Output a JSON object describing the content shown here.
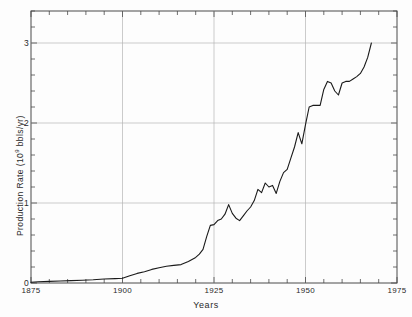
{
  "chart_data": {
    "type": "line",
    "title": "",
    "xlabel": "Years",
    "ylabel": "Production Rate (10⁹ bbls/yr)",
    "ylabel_prefix": "Production Rate (10",
    "ylabel_exponent": "9",
    "ylabel_suffix": " bbls/yr)",
    "xlim": [
      1875,
      1975
    ],
    "ylim": [
      0,
      3.4
    ],
    "xticks": [
      1875,
      1900,
      1925,
      1950,
      1975
    ],
    "xtick_labels": [
      "1875",
      "1900",
      "1925",
      "1950",
      "1975"
    ],
    "xminor_step": 5,
    "yticks": [
      0,
      1,
      2,
      3
    ],
    "ytick_labels": [
      "0",
      "1",
      "2",
      "3"
    ],
    "yminor_step": 0.2,
    "grid": "major-y-and-x",
    "line_color": "#1a1a1a",
    "axis_color": "#4a4a4a",
    "grid_color": "#b4b4b4",
    "background_color": "#fdfdfd",
    "legend": null,
    "series": [
      {
        "name": "World crude oil production rate",
        "x": [
          1875,
          1877,
          1880,
          1883,
          1886,
          1889,
          1892,
          1895,
          1898,
          1900,
          1902,
          1904,
          1906,
          1908,
          1910,
          1912,
          1914,
          1916,
          1918,
          1920,
          1921,
          1922,
          1923,
          1924,
          1925,
          1926,
          1927,
          1928,
          1929,
          1930,
          1931,
          1932,
          1933,
          1934,
          1935,
          1936,
          1937,
          1938,
          1939,
          1940,
          1941,
          1942,
          1943,
          1944,
          1945,
          1946,
          1947,
          1948,
          1949,
          1950,
          1951,
          1952,
          1953,
          1954,
          1955,
          1956,
          1957,
          1958,
          1959,
          1960,
          1961,
          1962,
          1963,
          1964,
          1965,
          1966,
          1967,
          1968
        ],
        "values": [
          0.01,
          0.015,
          0.02,
          0.025,
          0.03,
          0.035,
          0.04,
          0.05,
          0.055,
          0.06,
          0.09,
          0.12,
          0.14,
          0.17,
          0.19,
          0.21,
          0.22,
          0.23,
          0.27,
          0.32,
          0.36,
          0.42,
          0.58,
          0.72,
          0.73,
          0.78,
          0.8,
          0.86,
          0.98,
          0.87,
          0.81,
          0.78,
          0.84,
          0.9,
          0.95,
          1.03,
          1.17,
          1.13,
          1.25,
          1.2,
          1.22,
          1.12,
          1.27,
          1.38,
          1.42,
          1.56,
          1.7,
          1.88,
          1.74,
          1.98,
          2.2,
          2.22,
          2.22,
          2.22,
          2.42,
          2.52,
          2.5,
          2.4,
          2.35,
          2.5,
          2.52,
          2.52,
          2.55,
          2.58,
          2.62,
          2.7,
          2.82,
          3.0
        ]
      }
    ]
  },
  "tick_marks": {
    "x_minor_count": 20,
    "y_minor_count": 17
  }
}
